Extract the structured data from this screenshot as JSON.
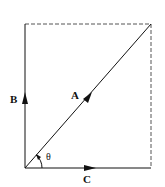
{
  "diagram": {
    "type": "vector-diagram",
    "colors": {
      "line": "#111111",
      "dashed": "#555555",
      "background": "#ffffff"
    },
    "vectors": {
      "A": {
        "label": "A",
        "from": [
          25,
          168
        ],
        "to": [
          151,
          24
        ],
        "role": "resultant"
      },
      "B": {
        "label": "B",
        "from": [
          25,
          168
        ],
        "to": [
          25,
          24
        ],
        "role": "vertical-component"
      },
      "C": {
        "label": "C",
        "from": [
          25,
          168
        ],
        "to": [
          151,
          168
        ],
        "role": "horizontal-component"
      }
    },
    "angle": {
      "label": "θ",
      "between": [
        "C",
        "A"
      ],
      "vertex": [
        25,
        168
      ]
    },
    "dashed_edges": [
      {
        "name": "top-edge",
        "from": [
          25,
          24
        ],
        "to": [
          151,
          24
        ]
      },
      {
        "name": "right-edge",
        "from": [
          151,
          24
        ],
        "to": [
          151,
          168
        ]
      }
    ]
  }
}
